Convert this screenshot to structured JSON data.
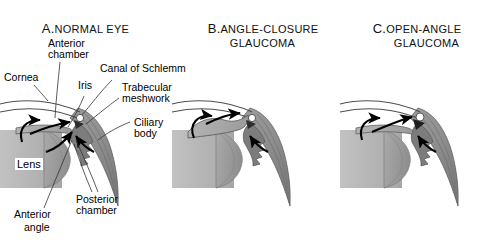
{
  "figure": {
    "type": "anatomical-diagram",
    "background_color": "#ffffff",
    "panel_count": 3
  },
  "panels": [
    {
      "id": "A",
      "prefix": "A.",
      "title": "NORMAL EYE",
      "title_lines": [
        "NORMAL EYE"
      ],
      "angle_state": "open",
      "labeled": true
    },
    {
      "id": "B",
      "prefix": "B.",
      "title": "ANGLE-CLOSURE GLAUCOMA",
      "title_lines": [
        "ANGLE-CLOSURE",
        "GLAUCOMA"
      ],
      "angle_state": "closed",
      "labeled": false
    },
    {
      "id": "C",
      "prefix": "C.",
      "title": "OPEN-ANGLE GLAUCOMA",
      "title_lines": [
        "OPEN-ANGLE",
        "GLAUCOMA"
      ],
      "angle_state": "open-but-obstructed",
      "labeled": false
    }
  ],
  "labels": {
    "cornea": "Cornea",
    "anterior_chamber_l1": "Anterior",
    "anterior_chamber_l2": "chamber",
    "iris": "Iris",
    "canal_of_schlemm": "Canal of Schlemm",
    "trabecular_l1": "Trabecular",
    "trabecular_l2": "meshwork",
    "ciliary_l1": "Ciliary",
    "ciliary_l2": "body",
    "lens": "Lens",
    "posterior_chamber_l1": "Posterior",
    "posterior_chamber_l2": "chamber",
    "anterior_angle_l1": "Anterior",
    "anterior_angle_l2": "angle"
  },
  "colors": {
    "background": "#ffffff",
    "ink": "#000000",
    "outline": "#4a4a4a",
    "lens_light": "#b7b7b7",
    "lens_mid": "#9a9a9a",
    "lens_dark": "#8a8a8a",
    "iris_gray": "#a8a8a8",
    "ciliary_dark": "#6e6e6e",
    "ciliary_mid": "#8c8c8c",
    "sclera_fill": "#b0b0b0",
    "arrow": "#000000"
  },
  "legend_notes": {
    "arrows_meaning": "Arrows trace aqueous humor flow from the posterior chamber, through the pupil, into the anterior chamber and out via the trabecular meshwork"
  }
}
